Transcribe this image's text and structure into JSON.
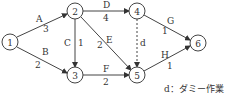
{
  "diagram": {
    "type": "arrow-diagram",
    "colors": {
      "line": "#444444",
      "text": "#333333",
      "background": "#ffffff"
    },
    "nodes": [
      {
        "id": "1",
        "label": "1",
        "x": 10,
        "y": 42
      },
      {
        "id": "2",
        "label": "2",
        "x": 75,
        "y": 11
      },
      {
        "id": "3",
        "label": "3",
        "x": 75,
        "y": 75
      },
      {
        "id": "4",
        "label": "4",
        "x": 137,
        "y": 11
      },
      {
        "id": "5",
        "label": "5",
        "x": 137,
        "y": 75
      },
      {
        "id": "6",
        "label": "6",
        "x": 198,
        "y": 43
      }
    ],
    "edges": [
      {
        "from": "1",
        "to": "2",
        "name": "A",
        "duration": "3",
        "dashed": false
      },
      {
        "from": "1",
        "to": "3",
        "name": "B",
        "duration": "2",
        "dashed": false
      },
      {
        "from": "2",
        "to": "3",
        "name": "C",
        "duration": "1",
        "dashed": false
      },
      {
        "from": "2",
        "to": "4",
        "name": "D",
        "duration": "4",
        "dashed": false
      },
      {
        "from": "2",
        "to": "5",
        "name": "E",
        "duration": "2",
        "dashed": false
      },
      {
        "from": "3",
        "to": "5",
        "name": "F",
        "duration": "2",
        "dashed": false
      },
      {
        "from": "4",
        "to": "6",
        "name": "G",
        "duration": "1",
        "dashed": false
      },
      {
        "from": "5",
        "to": "6",
        "name": "H",
        "duration": "1",
        "dashed": false
      },
      {
        "from": "4",
        "to": "5",
        "name": "d",
        "duration": "",
        "dashed": true
      }
    ],
    "legend": "d：ダミー作業"
  }
}
